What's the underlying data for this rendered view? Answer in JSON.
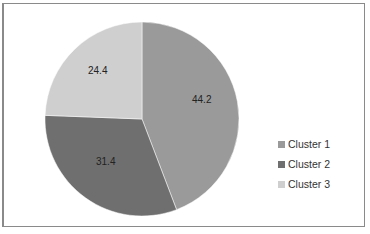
{
  "chart_data": {
    "type": "pie",
    "title": "",
    "categories": [
      "Cluster 1",
      "Cluster 2",
      "Cluster 3"
    ],
    "values": [
      44.2,
      31.4,
      24.4
    ],
    "colors": [
      "#9a9a9a",
      "#6f6f6f",
      "#cfcfcf"
    ],
    "legend_position": "right",
    "start_angle": "12 o'clock, clockwise"
  },
  "labels": {
    "slice1": "44.2",
    "slice2": "31.4",
    "slice3": "24.4"
  },
  "legend": {
    "items": [
      {
        "label": "Cluster 1",
        "color": "#9a9a9a"
      },
      {
        "label": "Cluster 2",
        "color": "#6f6f6f"
      },
      {
        "label": "Cluster 3",
        "color": "#cfcfcf"
      }
    ]
  }
}
